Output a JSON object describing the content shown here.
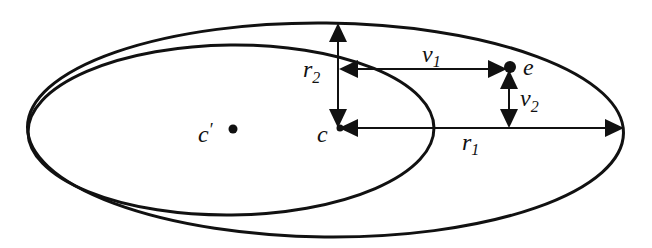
{
  "diagram": {
    "colors": {
      "stroke": "#111111",
      "background": "#ffffff"
    },
    "labels": {
      "c_prime": "c",
      "c_prime_mark": "′",
      "c": "c",
      "e": "e",
      "r1": "r",
      "r1_sub": "1",
      "r2": "r",
      "r2_sub": "2",
      "v1": "v",
      "v1_sub": "1",
      "v2": "v",
      "v2_sub": "2"
    },
    "shapes": {
      "outer_ellipse": "outer-ellipse",
      "inner_ellipse": "inner-ellipse"
    },
    "arrows": [
      {
        "id": "r1",
        "from": "c",
        "to": "outer-ellipse-right-vertex",
        "direction": "horizontal"
      },
      {
        "id": "r2",
        "from": "c",
        "to": "outer-ellipse-top",
        "direction": "vertical"
      },
      {
        "id": "v1",
        "from": "r2-axis",
        "to": "e",
        "direction": "horizontal",
        "double_headed": true
      },
      {
        "id": "v2",
        "from": "e",
        "to": "r1-axis",
        "direction": "vertical",
        "double_headed": true
      }
    ]
  }
}
